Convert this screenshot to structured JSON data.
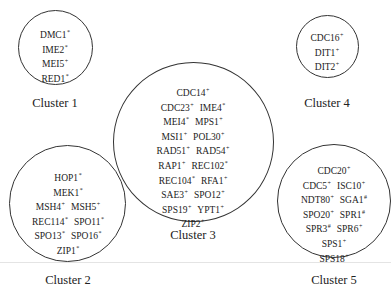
{
  "diagram": {
    "clusters": [
      {
        "label": "Cluster 1",
        "rows": [
          [
            {
              "name": "DMC1",
              "mark": "*"
            }
          ],
          [
            {
              "name": "IME2",
              "mark": "*"
            }
          ],
          [
            {
              "name": "MEI5",
              "mark": "+"
            }
          ],
          [
            {
              "name": "RED1",
              "mark": "*"
            }
          ]
        ]
      },
      {
        "label": "Cluster 2",
        "rows": [
          [
            {
              "name": "HOP1",
              "mark": "*"
            }
          ],
          [
            {
              "name": "MEK1",
              "mark": "*"
            }
          ],
          [
            {
              "name": "MSH4",
              "mark": "+"
            },
            {
              "name": "MSH5",
              "mark": "+"
            }
          ],
          [
            {
              "name": "REC114",
              "mark": "*"
            },
            {
              "name": "SPO11",
              "mark": "*"
            }
          ],
          [
            {
              "name": "SPO13",
              "mark": "*"
            },
            {
              "name": "SPO16",
              "mark": "*"
            }
          ],
          [
            {
              "name": "ZIP1",
              "mark": "*"
            }
          ]
        ]
      },
      {
        "label": "Cluster 3",
        "rows": [
          [
            {
              "name": "CDC14",
              "mark": "+"
            }
          ],
          [
            {
              "name": "CDC23",
              "mark": "+"
            },
            {
              "name": "IME4",
              "mark": "*"
            }
          ],
          [
            {
              "name": "MEI4",
              "mark": "*"
            },
            {
              "name": "MPS1",
              "mark": "+"
            }
          ],
          [
            {
              "name": "MSI1",
              "mark": "+"
            },
            {
              "name": "POL30",
              "mark": "+"
            }
          ],
          [
            {
              "name": "RAD51",
              "mark": "+"
            },
            {
              "name": "RAD54",
              "mark": "+"
            }
          ],
          [
            {
              "name": "RAP1",
              "mark": "+"
            },
            {
              "name": "REC102",
              "mark": "*"
            }
          ],
          [
            {
              "name": "REC104",
              "mark": "*"
            },
            {
              "name": "RFA1",
              "mark": "+"
            }
          ],
          [
            {
              "name": "SAE3",
              "mark": "+"
            },
            {
              "name": "SPO12",
              "mark": "+"
            }
          ],
          [
            {
              "name": "SPS19",
              "mark": "+"
            },
            {
              "name": "YPT1",
              "mark": "+"
            }
          ],
          [
            {
              "name": "ZIP2",
              "mark": "+"
            }
          ]
        ]
      },
      {
        "label": "Cluster 4",
        "rows": [
          [
            {
              "name": "CDC16",
              "mark": "+"
            }
          ],
          [
            {
              "name": "DIT1",
              "mark": "+"
            }
          ],
          [
            {
              "name": "DIT2",
              "mark": "+"
            }
          ]
        ]
      },
      {
        "label": "Cluster 5",
        "rows": [
          [
            {
              "name": "CDC20",
              "mark": "+"
            }
          ],
          [
            {
              "name": "CDC5",
              "mark": "+"
            },
            {
              "name": "ISC10",
              "mark": "+"
            }
          ],
          [
            {
              "name": "NDT80",
              "mark": "+"
            },
            {
              "name": "SGA1",
              "mark": "#"
            }
          ],
          [
            {
              "name": "SPO20",
              "mark": "+"
            },
            {
              "name": "SPR1",
              "mark": "#"
            }
          ],
          [
            {
              "name": "SPR3",
              "mark": "#"
            },
            {
              "name": "SPR6",
              "mark": "+"
            }
          ],
          [
            {
              "name": "SPS1",
              "mark": "+"
            }
          ],
          [
            {
              "name": "SPS18",
              "mark": "+"
            }
          ]
        ]
      }
    ]
  }
}
